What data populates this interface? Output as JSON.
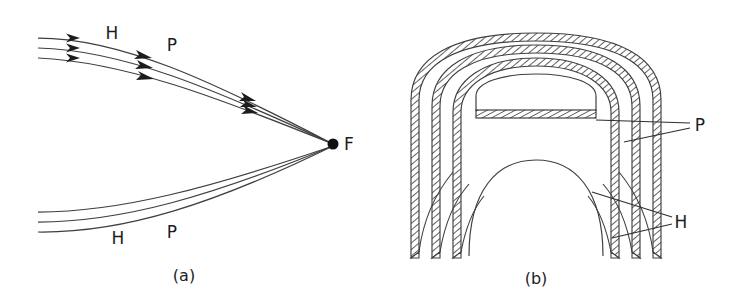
{
  "figure": {
    "background_color": "#ffffff",
    "stroke_color": "#3a3a3a",
    "ink_color": "#1c1c1c",
    "panels": [
      {
        "id": "panel-a",
        "caption": "(a)",
        "caption_x": 184,
        "caption_y": 281,
        "description": "ray trace converging to focal point",
        "focal_point": {
          "label": "F",
          "x": 333,
          "y": 144,
          "radius": 5.5,
          "label_x": 344,
          "label_y": 150
        },
        "labels": [
          {
            "text": "H",
            "x": 112,
            "y": 39,
            "group": "upper"
          },
          {
            "text": "P",
            "x": 172,
            "y": 51,
            "group": "upper"
          },
          {
            "text": "H",
            "x": 118,
            "y": 244,
            "group": "lower"
          },
          {
            "text": "P",
            "x": 172,
            "y": 238,
            "group": "lower"
          }
        ],
        "upper_rays": [
          {
            "start_x": 38,
            "start_y": 38,
            "c1x": 120,
            "c1y": 38,
            "c2x": 210,
            "c2y": 80,
            "end_x": 333,
            "end_y": 144
          },
          {
            "start_x": 38,
            "start_y": 48,
            "c1x": 122,
            "c1y": 50,
            "c2x": 212,
            "c2y": 88,
            "end_x": 333,
            "end_y": 144
          },
          {
            "start_x": 38,
            "start_y": 58,
            "c1x": 124,
            "c1y": 62,
            "c2x": 214,
            "c2y": 96,
            "end_x": 333,
            "end_y": 144
          }
        ],
        "lower_rays": [
          {
            "start_x": 38,
            "start_y": 212,
            "c1x": 120,
            "c1y": 212,
            "c2x": 210,
            "c2y": 188,
            "end_x": 333,
            "end_y": 146
          },
          {
            "start_x": 38,
            "start_y": 222,
            "c1x": 122,
            "c1y": 222,
            "c2x": 212,
            "c2y": 196,
            "end_x": 333,
            "end_y": 146
          },
          {
            "start_x": 38,
            "start_y": 232,
            "c1x": 124,
            "c1y": 233,
            "c2x": 214,
            "c2y": 204,
            "end_x": 333,
            "end_y": 146
          }
        ],
        "arrow_stations": [
          {
            "x": 76,
            "y": 38,
            "angle": 3
          },
          {
            "x": 76,
            "y": 48,
            "angle": 3
          },
          {
            "x": 76,
            "y": 58,
            "angle": 3
          },
          {
            "x": 146,
            "y": 56,
            "angle": 20
          },
          {
            "x": 147,
            "y": 66,
            "angle": 21
          },
          {
            "x": 148,
            "y": 77,
            "angle": 22
          },
          {
            "x": 249,
            "y": 98,
            "angle": 29
          },
          {
            "x": 251,
            "y": 104,
            "angle": 29
          },
          {
            "x": 253,
            "y": 110,
            "angle": 29
          }
        ]
      },
      {
        "id": "panel-b",
        "caption": "(b)",
        "caption_x": 536,
        "caption_y": 284,
        "description": "cross-section of nested hatched arch bands",
        "labels": [
          {
            "text": "P",
            "x": 700,
            "y": 131,
            "group": "plate"
          },
          {
            "text": "H",
            "x": 681,
            "y": 228,
            "group": "hatched"
          }
        ],
        "leader_lines": [
          {
            "from_x": 596,
            "from_y": 118,
            "to_x": 690,
            "to_y": 122,
            "target": "P"
          },
          {
            "from_x": 625,
            "from_y": 141,
            "to_x": 690,
            "to_y": 127,
            "target": "P"
          },
          {
            "from_x": 592,
            "from_y": 190,
            "to_x": 672,
            "to_y": 216,
            "target": "H"
          },
          {
            "from_x": 614,
            "from_y": 237,
            "to_x": 672,
            "to_y": 223,
            "target": "H"
          }
        ],
        "bands": [
          {
            "name": "outer-band",
            "half_width": 125,
            "top_y": 33,
            "bottom_y": 258,
            "thickness": 8
          },
          {
            "name": "middle-band",
            "half_width": 104,
            "top_y": 44,
            "bottom_y": 258,
            "thickness": 8
          },
          {
            "name": "inner-band",
            "half_width": 83,
            "top_y": 56,
            "bottom_y": 258,
            "thickness": 8
          }
        ],
        "inner_dome": {
          "half_width": 60,
          "top_y": 76,
          "base_y": 110
        },
        "inner_bar": {
          "x1": 478,
          "x2": 596,
          "y": 110,
          "height": 8
        },
        "core_arc": {
          "half_width": 62,
          "top_y": 160,
          "bottom_y": 256
        },
        "center_x": 536
      }
    ]
  }
}
